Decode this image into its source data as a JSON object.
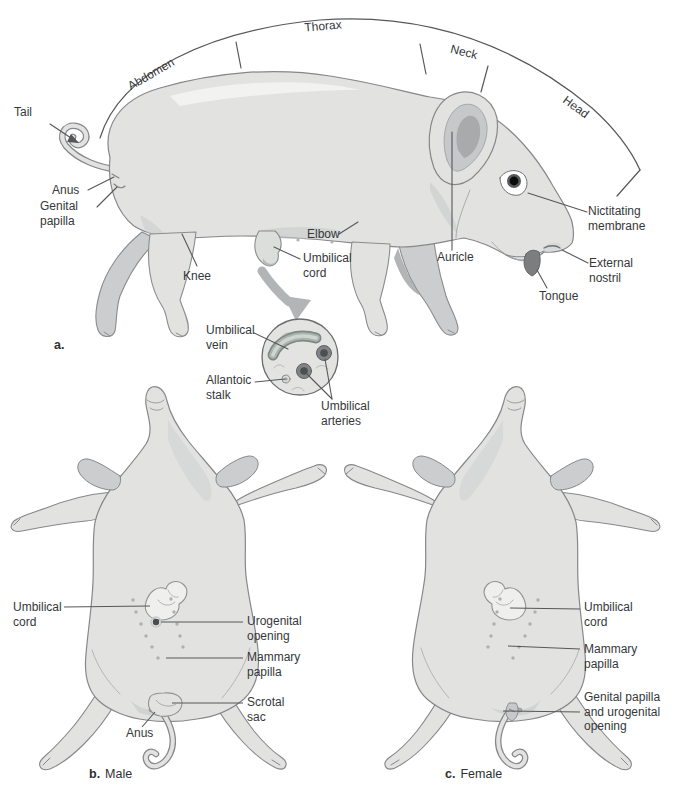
{
  "panel_a": {
    "figure_letter": "a.",
    "regions": {
      "abdomen": "Abdomen",
      "thorax": "Thorax",
      "neck": "Neck",
      "head": "Head"
    },
    "labels": {
      "tail": "Tail",
      "anus": "Anus",
      "genital_papilla": "Genital papilla",
      "knee": "Knee",
      "elbow": "Elbow",
      "umbilical_cord": "Umbilical cord",
      "auricle": "Auricle",
      "nictitating_membrane": "Nictitating membrane",
      "external_nostril": "External nostril",
      "tongue": "Tongue"
    },
    "inset_labels": {
      "umbilical_vein": "Umbilical vein",
      "allantoic_stalk": "Allantoic stalk",
      "umbilical_arteries": "Umbilical arteries"
    }
  },
  "panel_b": {
    "figure_letter": "b.",
    "caption": "Male",
    "labels": {
      "umbilical_cord": "Umbilical cord",
      "urogenital_opening": "Urogenital opening",
      "mammary_papilla": "Mammary papilla",
      "scrotal_sac": "Scrotal sac",
      "anus": "Anus"
    }
  },
  "panel_c": {
    "figure_letter": "c.",
    "caption": "Female",
    "labels": {
      "umbilical_cord": "Umbilical cord",
      "mammary_papilla": "Mammary papilla",
      "genital_papilla_urogenital": "Genital papilla and urogenital opening"
    }
  },
  "colors": {
    "body_fill": "#e2e3e1",
    "body_shadow": "#c9cbcd",
    "outline": "#85878a",
    "leader_line": "#55575a",
    "label_text": "#35373a",
    "artery": "#808486",
    "vein": "#aab3ad",
    "arrow": "#b2b4b6",
    "inset_fill": "#e3e4e2"
  }
}
